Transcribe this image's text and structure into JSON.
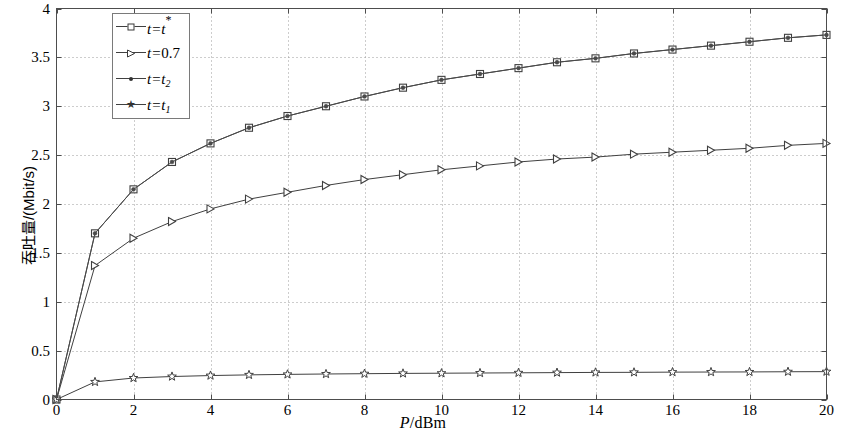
{
  "chart_data": {
    "type": "line",
    "title": "",
    "xlabel": "P/dBm",
    "ylabel": "吞吐量/(Mbit/s)",
    "xlim": [
      0,
      20
    ],
    "ylim": [
      0,
      4
    ],
    "xticks": [
      0,
      2,
      4,
      6,
      8,
      10,
      12,
      14,
      16,
      18,
      20
    ],
    "xtick_labels": [
      "0",
      "2",
      "4",
      "6",
      "8",
      "10",
      "12",
      "14",
      "16",
      "18",
      "20"
    ],
    "yticks": [
      0,
      0.5,
      1,
      1.5,
      2,
      2.5,
      3,
      3.5,
      4
    ],
    "ytick_labels": [
      "0",
      "0.5",
      "1",
      "1.5",
      "2",
      "2.5",
      "3",
      "3.5",
      "4"
    ],
    "grid": true,
    "grid_style": "dotted",
    "legend_position": "upper-left-inset",
    "x": [
      0,
      1,
      2,
      3,
      4,
      5,
      6,
      7,
      8,
      9,
      10,
      11,
      12,
      13,
      14,
      15,
      16,
      17,
      18,
      19,
      20
    ],
    "series": [
      {
        "name": "t=t*",
        "marker": "square",
        "color": "#404040",
        "values": [
          0.0,
          1.7,
          2.15,
          2.43,
          2.62,
          2.78,
          2.9,
          3.0,
          3.1,
          3.19,
          3.27,
          3.33,
          3.39,
          3.45,
          3.49,
          3.54,
          3.58,
          3.62,
          3.66,
          3.7,
          3.73
        ]
      },
      {
        "name": "t=0.7",
        "marker": "right-triangle",
        "color": "#404040",
        "values": [
          0.0,
          1.37,
          1.65,
          1.82,
          1.95,
          2.05,
          2.12,
          2.19,
          2.25,
          2.3,
          2.35,
          2.39,
          2.43,
          2.46,
          2.48,
          2.51,
          2.53,
          2.55,
          2.57,
          2.6,
          2.62
        ]
      },
      {
        "name": "t=t2",
        "marker": "dot",
        "color": "#4a4a4a",
        "values": [
          0.0,
          1.7,
          2.15,
          2.43,
          2.62,
          2.78,
          2.9,
          3.0,
          3.1,
          3.19,
          3.27,
          3.33,
          3.39,
          3.45,
          3.49,
          3.54,
          3.58,
          3.62,
          3.66,
          3.7,
          3.73
        ]
      },
      {
        "name": "t=t1",
        "marker": "star",
        "color": "#404040",
        "values": [
          0.0,
          0.18,
          0.22,
          0.235,
          0.245,
          0.252,
          0.257,
          0.261,
          0.264,
          0.267,
          0.269,
          0.271,
          0.273,
          0.275,
          0.277,
          0.278,
          0.28,
          0.281,
          0.282,
          0.284,
          0.285
        ]
      }
    ]
  },
  "axes": {
    "xlabel_italic": "P",
    "xlabel_rest": "/dBm",
    "ylabel": "吞吐量/(Mbit/s)"
  },
  "legend": {
    "entries": [
      {
        "label": "t=t*",
        "prefix": "t=",
        "base": "t",
        "sup": "*",
        "sub": "",
        "marker": "square-marker"
      },
      {
        "label": "t=0.7",
        "prefix": "t=",
        "base": "0.7",
        "sup": "",
        "sub": "",
        "marker": "right-triangle-marker"
      },
      {
        "label": "t=t2",
        "prefix": "t=",
        "base": "t",
        "sup": "",
        "sub": "2",
        "marker": "dot-marker"
      },
      {
        "label": "t=t1",
        "prefix": "t=",
        "base": "t",
        "sup": "",
        "sub": "1",
        "marker": "star-marker"
      }
    ]
  },
  "colors": {
    "axis": "#4d4d4d",
    "grid": "#9a9a9a",
    "line": "#404040",
    "background": "#ffffff"
  }
}
